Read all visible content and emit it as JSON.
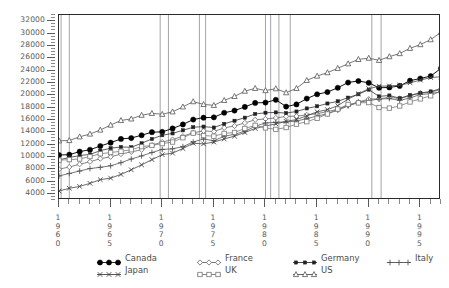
{
  "chart_data": {
    "type": "line",
    "title": "",
    "xlabel": "",
    "ylabel": "",
    "xlim": [
      1960,
      1997
    ],
    "ylim": [
      3000,
      33000
    ],
    "grid": "vertical-recession-bands",
    "legend_position": "bottom",
    "y_ticks": [
      4000,
      6000,
      8000,
      10000,
      12000,
      14000,
      16000,
      18000,
      20000,
      22000,
      24000,
      26000,
      28000,
      30000,
      32000
    ],
    "y_tick_labels": [
      "4000",
      "6000",
      "8000",
      "10000",
      "12000",
      "14000",
      "16000",
      "18000",
      "20000",
      "22000",
      "24000",
      "26000",
      "28000",
      "30000",
      "32000"
    ],
    "y_minor_step": 500,
    "x_ticks": [
      1960,
      1965,
      1970,
      1975,
      1980,
      1985,
      1990,
      1995
    ],
    "x_tick_labels": [
      "1960",
      "1965",
      "1970",
      "1975",
      "1980",
      "1985",
      "1990",
      "1995"
    ],
    "x_minor_step": 1,
    "recession_bands": [
      {
        "start": 1960.2,
        "end": 1961.0
      },
      {
        "start": 1969.8,
        "end": 1970.6
      },
      {
        "start": 1973.6,
        "end": 1974.2
      },
      {
        "start": 1980.0,
        "end": 1980.5
      },
      {
        "start": 1981.3,
        "end": 1982.4
      },
      {
        "start": 1990.3,
        "end": 1991.2
      }
    ],
    "x": [
      1960,
      1961,
      1962,
      1963,
      1964,
      1965,
      1966,
      1967,
      1968,
      1969,
      1970,
      1971,
      1972,
      1973,
      1974,
      1975,
      1976,
      1977,
      1978,
      1979,
      1980,
      1981,
      1982,
      1983,
      1984,
      1985,
      1986,
      1987,
      1988,
      1989,
      1990,
      1991,
      1992,
      1993,
      1994,
      1995,
      1996,
      1997
    ],
    "series": [
      {
        "name": "Canada",
        "marker": "filled-circle",
        "color": "#111111",
        "values": [
          10300,
          10350,
          10850,
          11150,
          11750,
          12300,
          12900,
          13050,
          13500,
          14000,
          14050,
          14600,
          15250,
          16050,
          16350,
          16400,
          17150,
          17500,
          18100,
          18750,
          18800,
          19250,
          18150,
          18500,
          19450,
          20150,
          20500,
          21200,
          22050,
          22300,
          22000,
          21200,
          21250,
          21500,
          22350,
          22700,
          23100,
          24350
        ]
      },
      {
        "name": "France",
        "marker": "open-diamond",
        "color": "#666666",
        "values": [
          8000,
          8350,
          8800,
          9200,
          9700,
          10000,
          10450,
          10800,
          11150,
          11900,
          12400,
          12800,
          13350,
          13900,
          14200,
          14100,
          14700,
          15000,
          15500,
          16000,
          16150,
          16300,
          16550,
          16600,
          16800,
          17000,
          17350,
          17700,
          18350,
          18900,
          19350,
          19400,
          19650,
          19450,
          19900,
          20350,
          20450,
          20950
        ]
      },
      {
        "name": "Germany",
        "marker": "filled-square",
        "color": "#333333",
        "values": [
          9500,
          9900,
          10200,
          10400,
          11000,
          11400,
          11600,
          11550,
          12200,
          12900,
          13500,
          13800,
          14300,
          14800,
          14900,
          14750,
          15350,
          15850,
          16350,
          16950,
          17150,
          17200,
          17100,
          17350,
          17850,
          18200,
          18650,
          19000,
          19600,
          20150,
          20900,
          19800,
          19950,
          19500,
          20000,
          20350,
          20600,
          21050
        ]
      },
      {
        "name": "Italy",
        "marker": "plus",
        "color": "#555555",
        "values": [
          6900,
          7300,
          7700,
          8100,
          8300,
          8550,
          9050,
          9650,
          10150,
          10700,
          11200,
          11300,
          11650,
          12400,
          12900,
          12600,
          13350,
          13650,
          14150,
          14950,
          15500,
          15600,
          15650,
          15800,
          16200,
          16600,
          17000,
          17550,
          18250,
          18800,
          19150,
          19350,
          19450,
          19150,
          19550,
          20100,
          20250,
          20550
        ]
      },
      {
        "name": "Japan",
        "marker": "cross",
        "color": "#444444",
        "values": [
          4450,
          4900,
          5200,
          5700,
          6300,
          6550,
          7150,
          7900,
          8700,
          9550,
          10350,
          10600,
          11350,
          12200,
          12100,
          12400,
          12900,
          13350,
          13950,
          14600,
          15000,
          15350,
          15750,
          16050,
          16650,
          17300,
          17650,
          18300,
          19350,
          20200,
          21050,
          21450,
          21500,
          21600,
          22000,
          22450,
          22850,
          23000
        ]
      },
      {
        "name": "UK",
        "marker": "open-square",
        "color": "#777777",
        "values": [
          9450,
          9550,
          9650,
          10050,
          10500,
          10700,
          10900,
          11150,
          11650,
          11850,
          12150,
          12400,
          13100,
          13850,
          13450,
          13350,
          13800,
          13950,
          14600,
          15100,
          14700,
          14450,
          14750,
          15300,
          15700,
          16250,
          16950,
          17750,
          18500,
          18750,
          18800,
          18000,
          17900,
          18250,
          18900,
          19400,
          19900,
          20700
        ]
      },
      {
        "name": "US",
        "marker": "open-triangle",
        "color": "#555555",
        "values": [
          12600,
          12650,
          13250,
          13700,
          14350,
          15150,
          15900,
          16150,
          16750,
          17050,
          16900,
          17300,
          18100,
          18950,
          18500,
          18350,
          19150,
          19800,
          20650,
          21100,
          20750,
          21050,
          20400,
          21100,
          22400,
          23100,
          23650,
          24350,
          25100,
          25800,
          26000,
          25650,
          26250,
          26750,
          27600,
          28200,
          29000,
          30200
        ]
      }
    ]
  },
  "y_axis": {
    "labels": [
      "32000",
      "30000",
      "28000",
      "26000",
      "24000",
      "22000",
      "20000",
      "18000",
      "16000",
      "14000",
      "12000",
      "10000",
      "8000",
      "6000",
      "4000"
    ]
  },
  "x_axis": {
    "labels": [
      "1960",
      "1965",
      "1970",
      "1975",
      "1980",
      "1985",
      "1990",
      "1995"
    ]
  },
  "legend": {
    "items": [
      {
        "label": "Canada",
        "marker": "filled-circle",
        "name": "legend-canada"
      },
      {
        "label": "France",
        "marker": "open-diamond",
        "name": "legend-france"
      },
      {
        "label": "Germany",
        "marker": "filled-square",
        "name": "legend-germany"
      },
      {
        "label": "Italy",
        "marker": "plus",
        "name": "legend-italy"
      },
      {
        "label": "Japan",
        "marker": "cross",
        "name": "legend-japan"
      },
      {
        "label": "UK",
        "marker": "open-square",
        "name": "legend-uk"
      },
      {
        "label": "US",
        "marker": "open-triangle",
        "name": "legend-us"
      }
    ]
  },
  "colors": {
    "frame": "#2a2a2a",
    "text": "#4a4a4a",
    "gridline": "#9a9aa0",
    "background": "#ffffff"
  }
}
